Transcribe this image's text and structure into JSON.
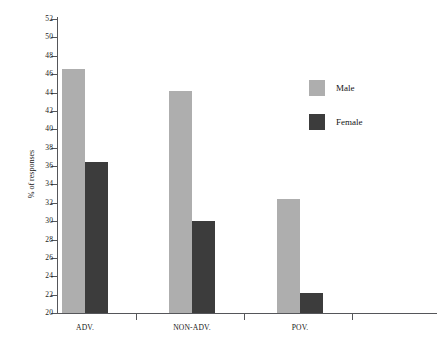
{
  "chart_data": {
    "type": "bar",
    "title": "",
    "subtitle": "",
    "xlabel": "",
    "ylabel": "% of responses",
    "categories": [
      "ADV.",
      "NON-ADV.",
      "POV."
    ],
    "series": [
      {
        "name": "Male",
        "color": "#aeaeae",
        "values": [
          46.6,
          44.2,
          32.4
        ]
      },
      {
        "name": "Female",
        "color": "#3c3c3c",
        "values": [
          36.4,
          30.0,
          22.2
        ]
      }
    ],
    "ylim": [
      20,
      52
    ],
    "ytick_step": 2,
    "yticks": [
      20,
      22,
      24,
      26,
      28,
      30,
      32,
      34,
      36,
      38,
      40,
      42,
      44,
      46,
      48,
      50,
      52
    ],
    "ytick_labels": [
      "20",
      "22",
      "24",
      "26",
      "28",
      "30",
      "32",
      "34",
      "36",
      "38",
      "40",
      "42",
      "44",
      "46",
      "48",
      "50",
      "52"
    ],
    "grid": false,
    "legend_position": "right",
    "legend_entries": [
      "Male",
      "Female"
    ],
    "annotations": []
  },
  "legend": {
    "male_label": "Male",
    "female_label": "Female"
  },
  "axes": {
    "y_title": "% of responses",
    "cat_1": "ADV.",
    "cat_2": "NON-ADV.",
    "cat_3": "POV."
  }
}
